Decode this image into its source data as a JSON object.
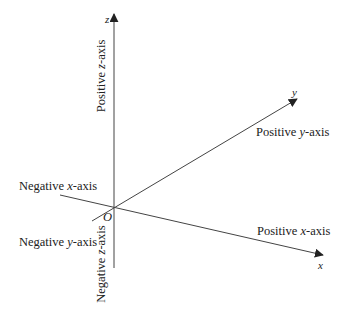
{
  "diagram": {
    "origin_label": "O",
    "axes": {
      "x": {
        "letter": "x",
        "positive_label_prefix": "Positive ",
        "positive_label_var": "x",
        "positive_label_suffix": "-axis",
        "negative_label_prefix": "Negative ",
        "negative_label_var": "x",
        "negative_label_suffix": "-axis"
      },
      "y": {
        "letter": "y",
        "positive_label_prefix": "Positive ",
        "positive_label_var": "y",
        "positive_label_suffix": "-axis",
        "negative_label_prefix": "Negative ",
        "negative_label_var": "y",
        "negative_label_suffix": "-axis"
      },
      "z": {
        "letter": "z",
        "positive_label_prefix": "Positive ",
        "positive_label_var": "z",
        "positive_label_suffix": "-axis",
        "negative_label_prefix": "Negative ",
        "negative_label_var": "z",
        "negative_label_suffix": "-axis"
      }
    },
    "colors": {
      "line": "#333333",
      "text": "#222222",
      "background": "#ffffff"
    }
  }
}
